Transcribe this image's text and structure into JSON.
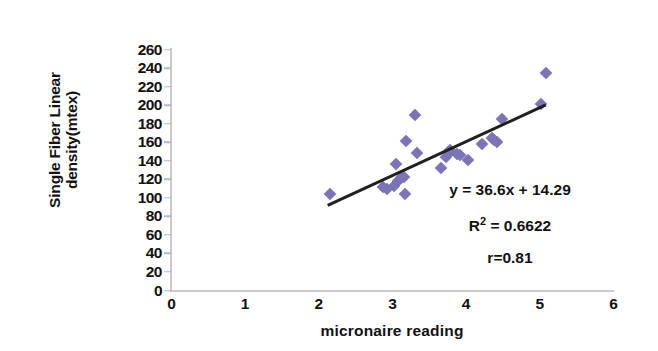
{
  "chart_data": {
    "type": "scatter",
    "title": "",
    "xlabel": "micronaire reading",
    "ylabel": "Single Fiber Linear density(mtex)",
    "ylabel_line1": "Single Fiber Linear",
    "ylabel_line2": "density(mtex)",
    "xlim": [
      0,
      6
    ],
    "ylim": [
      0,
      260
    ],
    "xticks": [
      0,
      1,
      2,
      3,
      4,
      5,
      6
    ],
    "yticks": [
      0,
      20,
      40,
      60,
      80,
      100,
      120,
      140,
      160,
      180,
      200,
      220,
      240,
      260
    ],
    "xtick_labels": [
      "0",
      "1",
      "2",
      "3",
      "4",
      "5",
      "6"
    ],
    "ytick_labels": [
      "0",
      "20",
      "40",
      "60",
      "80",
      "100",
      "120",
      "140",
      "160",
      "180",
      "200",
      "220",
      "240",
      "260"
    ],
    "grid": false,
    "legend": false,
    "marker_color": "#7c74b4",
    "marker_shape": "diamond",
    "trendline_color": "#221f1f",
    "axis_color": "#c9c9c9",
    "points": [
      {
        "x": 2.15,
        "y": 104
      },
      {
        "x": 2.87,
        "y": 112
      },
      {
        "x": 2.93,
        "y": 110
      },
      {
        "x": 3.02,
        "y": 113
      },
      {
        "x": 3.05,
        "y": 137
      },
      {
        "x": 3.08,
        "y": 118
      },
      {
        "x": 3.12,
        "y": 121
      },
      {
        "x": 3.15,
        "y": 122
      },
      {
        "x": 3.17,
        "y": 104
      },
      {
        "x": 3.18,
        "y": 161
      },
      {
        "x": 3.3,
        "y": 189
      },
      {
        "x": 3.33,
        "y": 148
      },
      {
        "x": 3.66,
        "y": 132
      },
      {
        "x": 3.72,
        "y": 144
      },
      {
        "x": 3.78,
        "y": 152
      },
      {
        "x": 3.8,
        "y": 151
      },
      {
        "x": 3.88,
        "y": 147
      },
      {
        "x": 3.92,
        "y": 146
      },
      {
        "x": 4.02,
        "y": 141
      },
      {
        "x": 4.22,
        "y": 158
      },
      {
        "x": 4.35,
        "y": 165
      },
      {
        "x": 4.38,
        "y": 162
      },
      {
        "x": 4.42,
        "y": 160
      },
      {
        "x": 4.48,
        "y": 185
      },
      {
        "x": 5.02,
        "y": 201
      },
      {
        "x": 5.08,
        "y": 235
      }
    ],
    "trendline": {
      "slope": 36.6,
      "intercept": 14.29,
      "x_start": 2.12,
      "x_end": 5.08
    },
    "annotations": {
      "equation": "y = 36.6x + 14.29",
      "r_squared_prefix": "R",
      "r_squared_sup": "2",
      "r_squared_value": " = 0.6622",
      "r_value": "r=0.81"
    }
  }
}
